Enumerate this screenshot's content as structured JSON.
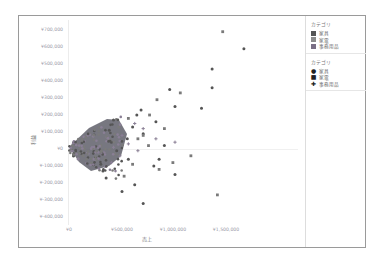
{
  "chart_data": {
    "type": "scatter",
    "title": "",
    "xlabel": "売上",
    "ylabel": "利益",
    "xlim": [
      0,
      1750000
    ],
    "ylim": [
      -420000,
      720000
    ],
    "x_ticks": [
      "¥0",
      "¥500,000",
      "¥1,000,000",
      "¥1,500,000"
    ],
    "y_ticks": [
      "¥700,000",
      "¥600,000",
      "¥500,000",
      "¥400,000",
      "¥300,000",
      "¥200,000",
      "¥100,000",
      "¥0",
      "¥-100,000",
      "¥-200,000",
      "¥-300,000",
      "¥-400,000"
    ],
    "grid": false,
    "legend_position": "right",
    "series": [
      {
        "name": "家具",
        "color": "#555555",
        "marker": "circle",
        "points": [
          [
            1650000,
            590000
          ],
          [
            1350000,
            470000
          ],
          [
            950000,
            350000
          ],
          [
            1350000,
            360000
          ],
          [
            1000000,
            250000
          ],
          [
            680000,
            230000
          ],
          [
            640000,
            200000
          ],
          [
            1250000,
            240000
          ],
          [
            820000,
            160000
          ],
          [
            420000,
            170000
          ],
          [
            380000,
            110000
          ],
          [
            700000,
            90000
          ],
          [
            550000,
            60000
          ],
          [
            900000,
            20000
          ],
          [
            450000,
            -10000
          ],
          [
            300000,
            -90000
          ],
          [
            320000,
            -130000
          ],
          [
            350000,
            -170000
          ],
          [
            500000,
            -250000
          ],
          [
            700000,
            -320000
          ],
          [
            620000,
            -210000
          ],
          [
            800000,
            -100000
          ],
          [
            250000,
            -50000
          ],
          [
            400000,
            40000
          ],
          [
            600000,
            130000
          ],
          [
            560000,
            -60000
          ],
          [
            850000,
            -60000
          ],
          [
            1000000,
            -150000
          ]
        ]
      },
      {
        "name": "家電",
        "color": "#7a7a7a",
        "marker": "square",
        "points": [
          [
            1450000,
            690000
          ],
          [
            1050000,
            330000
          ],
          [
            830000,
            290000
          ],
          [
            760000,
            200000
          ],
          [
            900000,
            120000
          ],
          [
            560000,
            180000
          ],
          [
            470000,
            130000
          ],
          [
            650000,
            60000
          ],
          [
            750000,
            20000
          ],
          [
            380000,
            50000
          ],
          [
            430000,
            -30000
          ],
          [
            600000,
            -90000
          ],
          [
            850000,
            -120000
          ],
          [
            1400000,
            -270000
          ],
          [
            520000,
            -160000
          ],
          [
            980000,
            -80000
          ],
          [
            700000,
            80000
          ],
          [
            340000,
            -60000
          ],
          [
            300000,
            20000
          ],
          [
            1150000,
            -40000
          ]
        ]
      },
      {
        "name": "事務用品",
        "color": "#8a7f95",
        "marker": "plus",
        "points": [
          [
            620000,
            150000
          ],
          [
            700000,
            120000
          ],
          [
            500000,
            80000
          ],
          [
            360000,
            70000
          ],
          [
            420000,
            10000
          ],
          [
            560000,
            30000
          ],
          [
            330000,
            -20000
          ],
          [
            480000,
            -40000
          ],
          [
            650000,
            -10000
          ],
          [
            400000,
            -80000
          ],
          [
            1000000,
            40000
          ],
          [
            820000,
            60000
          ]
        ]
      }
    ],
    "dense_cluster": {
      "description": "Dense mass of points from (0,0) fanning up to ~¥500,000 sales / ±¥150,000 profit",
      "x_range": [
        0,
        500000
      ],
      "y_range": [
        -150000,
        150000
      ]
    }
  },
  "axes": {
    "y_title": "利益",
    "x_title": "売上",
    "y_ticks": [
      "¥700,000",
      "¥600,000",
      "¥500,000",
      "¥400,000",
      "¥300,000",
      "¥200,000",
      "¥100,000",
      "¥0",
      "¥-100,000",
      "¥-200,000",
      "¥-300,000",
      "¥-400,000"
    ],
    "x_ticks": [
      "¥0",
      "¥500,000",
      "¥1,000,000",
      "¥1,500,000"
    ]
  },
  "legend": {
    "color_section": {
      "title": "カテゴリ",
      "items": [
        {
          "label": "家具",
          "color": "#555555"
        },
        {
          "label": "家電",
          "color": "#8c8c8c"
        },
        {
          "label": "事務用品",
          "color": "#7a6f85"
        }
      ]
    },
    "shape_section": {
      "title": "カテゴリ",
      "items": [
        {
          "label": "家具",
          "shape": "●"
        },
        {
          "label": "家電",
          "shape": "■"
        },
        {
          "label": "事務用品",
          "shape": "✚"
        }
      ]
    }
  }
}
